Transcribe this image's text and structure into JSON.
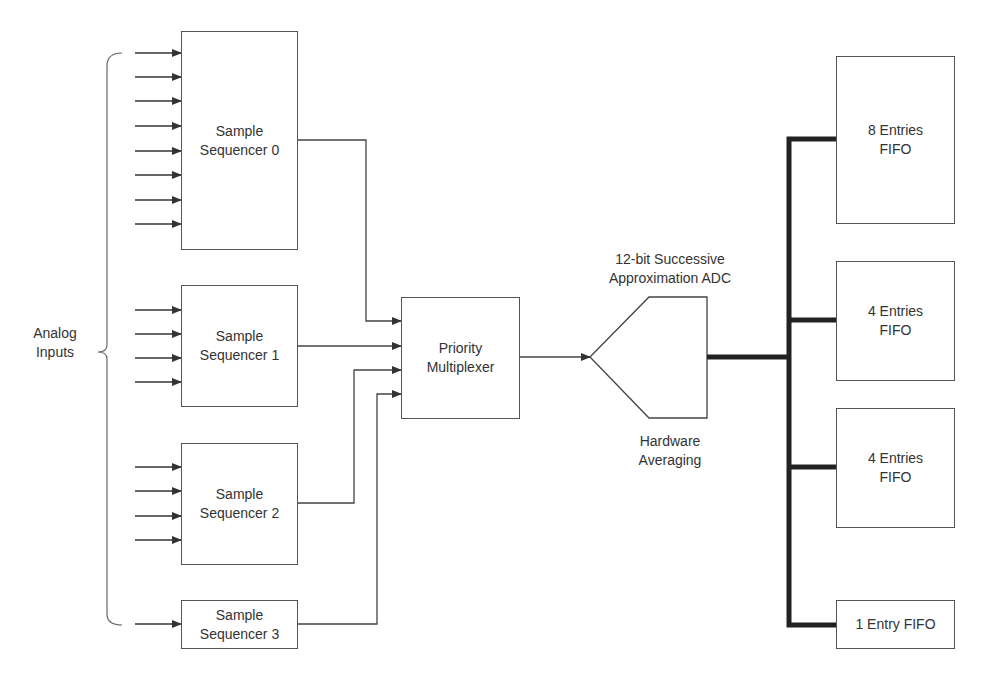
{
  "diagram": {
    "analog_inputs_label": "Analog\nInputs",
    "sequencers": [
      {
        "id": 0,
        "label": "Sample\nSequencer 0",
        "input_count": 8
      },
      {
        "id": 1,
        "label": "Sample\nSequencer 1",
        "input_count": 4
      },
      {
        "id": 2,
        "label": "Sample\nSequencer 2",
        "input_count": 4
      },
      {
        "id": 3,
        "label": "Sample\nSequencer 3",
        "input_count": 1
      }
    ],
    "multiplexer": {
      "label": "Priority\nMultiplexer"
    },
    "adc": {
      "title": "12-bit Successive\nApproximation ADC",
      "subtitle": "Hardware\nAveraging"
    },
    "fifos": [
      {
        "label": "8 Entries\nFIFO"
      },
      {
        "label": "4 Entries\nFIFO"
      },
      {
        "label": "4 Entries\nFIFO"
      },
      {
        "label": "1 Entry FIFO"
      }
    ],
    "colors": {
      "line": "#555555",
      "bus": "#222222",
      "text": "#333333",
      "background": "#ffffff"
    }
  }
}
